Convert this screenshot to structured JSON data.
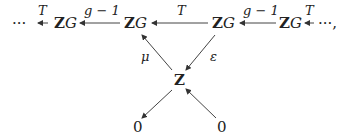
{
  "diagram": {
    "nodes": {
      "left_dots": "···",
      "zg1_bold": "Z",
      "zg1_ital": "G",
      "zg2_bold": "Z",
      "zg2_ital": "G",
      "zg3_bold": "Z",
      "zg3_ital": "G",
      "zg4_bold": "Z",
      "zg4_ital": "G",
      "right_dots": "···,",
      "z_center": "Z",
      "zero_left": "0",
      "zero_right": "0"
    },
    "labels": {
      "t_left": "T",
      "g_minus_1_left": "g − 1",
      "t_middle": "T",
      "g_minus_1_right": "g − 1",
      "t_right": "T",
      "mu": "μ",
      "epsilon": "ε"
    }
  }
}
